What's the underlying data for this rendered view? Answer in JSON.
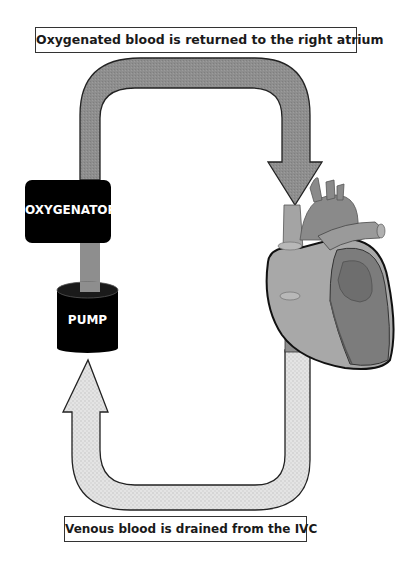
{
  "diagram": {
    "labels": {
      "top": "Oxygenated blood is returned to the right atrium",
      "bottom": "Venous blood is drained from the IVC"
    },
    "components": {
      "oxygenator": "OXYGENATOR",
      "pump": "PUMP",
      "heart": "Heart"
    },
    "flows": [
      {
        "from": "oxygenator",
        "to": "right atrium",
        "description": "Oxygenated blood is returned to the right atrium",
        "fill": "#8f8f8f"
      },
      {
        "from": "IVC",
        "to": "pump",
        "description": "Venous blood is drained from the IVC",
        "fill": "#dcdcdc"
      },
      {
        "from": "pump",
        "to": "oxygenator",
        "fill": "#8f8f8f"
      }
    ],
    "colors": {
      "oxygenated_arrow": "#8f8f8f",
      "venous_arrow": "#dcdcdc",
      "device_fill": "#000000",
      "heart_light": "#a8a8a8",
      "heart_dark": "#7a7a7a"
    }
  }
}
